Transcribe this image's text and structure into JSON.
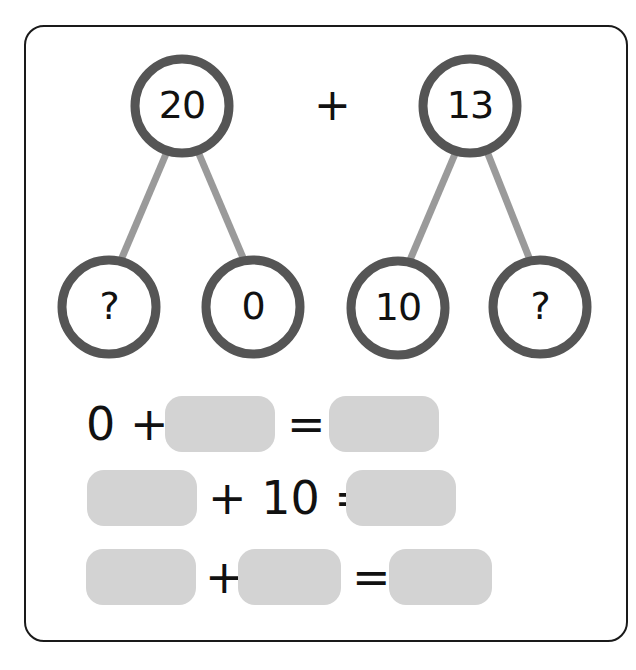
{
  "colors": {
    "frame_border": "#1a1a1a",
    "circle_stroke": "#555555",
    "branch_line": "#9a9a9a",
    "blank_box": "#d3d3d3",
    "text": "#111111"
  },
  "top_row": {
    "left_tree": {
      "whole": "20",
      "parts": [
        "?",
        "0"
      ]
    },
    "operator": "+",
    "right_tree": {
      "whole": "13",
      "parts": [
        "10",
        "?"
      ]
    }
  },
  "equations": [
    {
      "tokens": [
        "0",
        "+",
        "[blank]",
        "=",
        "[blank]"
      ],
      "text": [
        "0 +",
        "="
      ]
    },
    {
      "tokens": [
        "[blank]",
        "+",
        "10",
        "=",
        "[blank]"
      ],
      "text": [
        "+ 10 ="
      ]
    },
    {
      "tokens": [
        "[blank]",
        "+",
        "[blank]",
        "=",
        "[blank]"
      ],
      "text": [
        "+",
        "="
      ]
    }
  ]
}
